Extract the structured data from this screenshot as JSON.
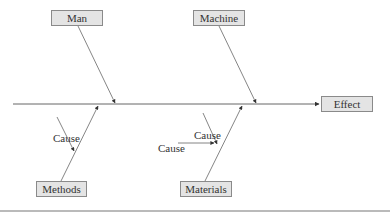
{
  "diagram": {
    "type": "fishbone (Ishikawa) cause-and-effect diagram",
    "effect": {
      "label": "Effect"
    },
    "categories": [
      {
        "id": "man",
        "label": "Man",
        "position": "top-left"
      },
      {
        "id": "machine",
        "label": "Machine",
        "position": "top-right"
      },
      {
        "id": "methods",
        "label": "Methods",
        "position": "bottom-left"
      },
      {
        "id": "materials",
        "label": "Materials",
        "position": "bottom-right"
      }
    ],
    "causes": [
      {
        "category": "methods",
        "label": "Cause"
      },
      {
        "category": "materials",
        "label": "Cause",
        "placement": "upper"
      },
      {
        "category": "materials",
        "label": "Cause",
        "placement": "lower"
      }
    ],
    "colors": {
      "line": "#555555",
      "box_fill": "#e4e4e4",
      "box_border": "#8a8a8a",
      "text": "#333333"
    }
  }
}
